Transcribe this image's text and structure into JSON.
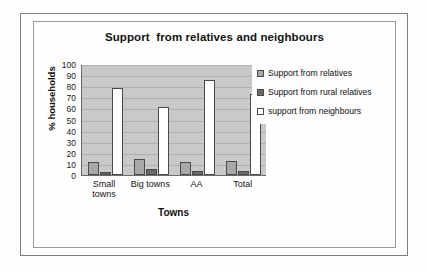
{
  "chart_data": {
    "type": "bar",
    "title": "Support  from relatives and neighbours",
    "xlabel": "Towns",
    "ylabel": "% households",
    "categories": [
      "Small towns",
      "Big towns",
      "AA",
      "Total"
    ],
    "category_lines": [
      [
        "Small",
        "towns"
      ],
      [
        "Big towns"
      ],
      [
        "AA"
      ],
      [
        "Total"
      ]
    ],
    "series": [
      {
        "name": "Support from relatives",
        "values": [
          12,
          14,
          12,
          13
        ],
        "color": "#a8a8a8"
      },
      {
        "name": "Support from rural relatives",
        "values": [
          3,
          5,
          4,
          4
        ],
        "color": "#6b6b6b"
      },
      {
        "name": "support from neighbours",
        "values": [
          78,
          61,
          86,
          73
        ],
        "color": "#ffffff"
      }
    ],
    "ylim": [
      0,
      100
    ],
    "ytick_step": 10,
    "yticks": [
      100,
      90,
      80,
      70,
      60,
      50,
      40,
      30,
      20,
      10,
      0
    ],
    "grid": true,
    "legend_position": "right",
    "plot_background": "#c9c9c9"
  },
  "legend": {
    "items": [
      {
        "label": "Support from relatives",
        "swatch": "light-gray"
      },
      {
        "label": "Support from rural relatives",
        "swatch": "dark-gray"
      },
      {
        "label": "support from neighbours",
        "swatch": "white"
      }
    ]
  }
}
